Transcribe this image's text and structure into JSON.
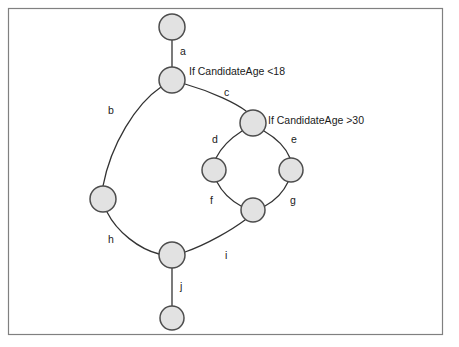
{
  "diagram": {
    "colors": {
      "background": "#ffffff",
      "frame_stroke": "#808080",
      "node_fill": "#e2e2e2",
      "node_stroke": "#4d4d4d",
      "edge_stroke": "#333333",
      "text": "#1a1a1a"
    },
    "frame": {
      "x": 8,
      "y": 8,
      "width": 435,
      "height": 327
    },
    "nodes": [
      {
        "id": "n1",
        "name": "node-top",
        "cx": 172,
        "cy": 27,
        "r": 13
      },
      {
        "id": "n2",
        "name": "node-decision-age",
        "cx": 172,
        "cy": 80,
        "r": 13
      },
      {
        "id": "n3",
        "name": "node-inner-top",
        "cx": 253,
        "cy": 123,
        "r": 13
      },
      {
        "id": "n4",
        "name": "node-inner-left",
        "cx": 214,
        "cy": 170,
        "r": 12
      },
      {
        "id": "n5",
        "name": "node-inner-right",
        "cx": 291,
        "cy": 170,
        "r": 12
      },
      {
        "id": "n6",
        "name": "node-inner-bottom",
        "cx": 253,
        "cy": 210,
        "r": 12
      },
      {
        "id": "n7",
        "name": "node-outer-left",
        "cx": 103,
        "cy": 199,
        "r": 13
      },
      {
        "id": "n8",
        "name": "node-junction",
        "cx": 172,
        "cy": 255,
        "r": 13
      },
      {
        "id": "n9",
        "name": "node-bottom",
        "cx": 172,
        "cy": 318,
        "r": 12
      }
    ],
    "edges": [
      {
        "id": "a",
        "name": "edge-a",
        "label": "a",
        "from": "n1",
        "to": "n2",
        "path": "M 172 40 L 172 67",
        "label_x": 180,
        "label_y": 55
      },
      {
        "id": "b",
        "name": "edge-b",
        "label": "b",
        "from": "n2",
        "to": "n7",
        "path": "M 161 87 C 136 104, 111 144, 103 186",
        "label_x": 108,
        "label_y": 114
      },
      {
        "id": "c",
        "name": "edge-c",
        "label": "c",
        "from": "n2",
        "to": "n3",
        "path": "M 185 84 C 213 92, 237 104, 246 111",
        "label_x": 224,
        "label_y": 96
      },
      {
        "id": "d",
        "name": "edge-d",
        "label": "d",
        "from": "n3",
        "to": "n4",
        "path": "M 242 131 C 231 138, 221 148, 216 158",
        "label_x": 212,
        "label_y": 143
      },
      {
        "id": "e",
        "name": "edge-e",
        "label": "e",
        "from": "n3",
        "to": "n5",
        "path": "M 264 131 C 276 138, 286 148, 290 158",
        "label_x": 291,
        "label_y": 143
      },
      {
        "id": "f",
        "name": "edge-f",
        "label": "f",
        "from": "n4",
        "to": "n6",
        "path": "M 217 182 C 222 192, 232 201, 241 206",
        "label_x": 210,
        "label_y": 204
      },
      {
        "id": "g",
        "name": "edge-g",
        "label": "g",
        "from": "n5",
        "to": "n6",
        "path": "M 288 182 C 283 193, 274 201, 265 206",
        "label_x": 290,
        "label_y": 204
      },
      {
        "id": "h",
        "name": "edge-h",
        "label": "h",
        "from": "n7",
        "to": "n8",
        "path": "M 107 212 C 117 232, 139 249, 159 254",
        "label_x": 108,
        "label_y": 243
      },
      {
        "id": "i",
        "name": "edge-i",
        "label": "i",
        "from": "n8",
        "to": "n6",
        "path": "M 185 252 C 208 244, 233 229, 245 220",
        "label_x": 225,
        "label_y": 259
      },
      {
        "id": "j",
        "name": "edge-j",
        "label": "j",
        "from": "n8",
        "to": "n9",
        "path": "M 172 268 L 172 306",
        "label_x": 180,
        "label_y": 290
      }
    ],
    "conditions": [
      {
        "id": "cond1",
        "name": "condition-age-under-18",
        "text": "If CandidateAge <18",
        "x": 189,
        "y": 75
      },
      {
        "id": "cond2",
        "name": "condition-age-over-30",
        "text": "If CandidateAge >30",
        "x": 268,
        "y": 124
      }
    ]
  }
}
